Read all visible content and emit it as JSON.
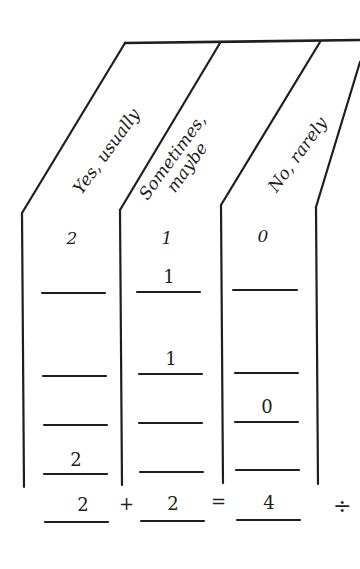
{
  "columns": [
    {
      "label": "Yes, usually",
      "score": "2"
    },
    {
      "label": "Sometimes,\nmaybe",
      "score": "1"
    },
    {
      "label": "No, rarely",
      "score": "0"
    }
  ],
  "rows": [
    [
      "",
      "1",
      ""
    ],
    [
      "",
      "1",
      ""
    ],
    [
      "",
      "",
      "0"
    ],
    [
      "2",
      "",
      ""
    ]
  ],
  "totals": {
    "col1": "2",
    "plus": "+",
    "col2": "2",
    "equals": "=",
    "col3": "4",
    "divide": "÷"
  }
}
